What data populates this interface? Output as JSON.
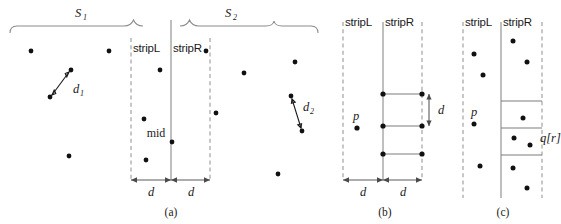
{
  "figure": {
    "panels": [
      {
        "id": "a",
        "caption": "(a)"
      },
      {
        "id": "b",
        "caption": "(b)"
      },
      {
        "id": "c",
        "caption": "(c)"
      }
    ],
    "colors": {
      "dot": "#111111",
      "solid_line": "#8a8a8a",
      "dashed_line": "#9a9a9a",
      "brace": "#8c8c8c",
      "rung": "#7d7d7d",
      "arrow": "#5a5a5a",
      "text": "#1a1a1a",
      "background": "#ffffff"
    }
  },
  "panel_a": {
    "caption": "(a)",
    "brace_left_label": "S",
    "brace_left_sub": "1",
    "brace_right_label": "S",
    "brace_right_sub": "2",
    "strip_left_label": "stripL",
    "strip_right_label": "stripR",
    "mid_label": "mid",
    "dist_left_label": "d",
    "dist_right_label": "d",
    "pair_left_label": "d",
    "pair_left_sub": "1",
    "pair_right_label": "d",
    "pair_right_sub": "2",
    "points": [
      {
        "x": 31,
        "y": 51
      },
      {
        "x": 109,
        "y": 51
      },
      {
        "x": 71,
        "y": 70
      },
      {
        "x": 50,
        "y": 97
      },
      {
        "x": 69,
        "y": 156
      },
      {
        "x": 160,
        "y": 70
      },
      {
        "x": 144,
        "y": 119
      },
      {
        "x": 172,
        "y": 142
      },
      {
        "x": 146,
        "y": 160
      },
      {
        "x": 206,
        "y": 51
      },
      {
        "x": 216,
        "y": 113
      },
      {
        "x": 244,
        "y": 73
      },
      {
        "x": 295,
        "y": 62
      },
      {
        "x": 291,
        "y": 96
      },
      {
        "x": 302,
        "y": 131
      },
      {
        "x": 278,
        "y": 174
      }
    ],
    "pair_left": {
      "x1": 71,
      "y1": 70,
      "x2": 50,
      "y2": 97
    },
    "pair_right": {
      "x1": 291,
      "y1": 96,
      "x2": 302,
      "y2": 131
    },
    "strip_left_x": 131,
    "mid_x": 171,
    "strip_right_x": 210
  },
  "panel_b": {
    "caption": "(b)",
    "strip_left_label": "stripL",
    "strip_right_label": "stripR",
    "point_p_label": "p",
    "dist_left_label": "d",
    "dist_right_label": "d",
    "dist_vertical_label": "d",
    "strip_left_x": 343,
    "mid_x": 383,
    "strip_right_x": 422,
    "points_p": [
      {
        "x": 357,
        "y": 128
      }
    ],
    "rung_points": [
      {
        "x": 383,
        "y": 94
      },
      {
        "x": 422,
        "y": 94
      },
      {
        "x": 383,
        "y": 126
      },
      {
        "x": 422,
        "y": 126
      },
      {
        "x": 383,
        "y": 154
      },
      {
        "x": 422,
        "y": 154
      }
    ],
    "rungs": [
      {
        "y": 94
      },
      {
        "y": 126
      },
      {
        "y": 154
      }
    ]
  },
  "panel_c": {
    "caption": "(c)",
    "strip_left_label": "stripL",
    "strip_right_label": "stripR",
    "point_p_label": "p",
    "point_q_label": "q[r]",
    "strip_left_x": 463,
    "mid_x": 501,
    "strip_right_x": 542,
    "rungs": [
      {
        "y": 101
      },
      {
        "y": 128
      },
      {
        "y": 155
      }
    ],
    "points": [
      {
        "x": 474,
        "y": 54
      },
      {
        "x": 483,
        "y": 75
      },
      {
        "x": 474,
        "y": 124
      },
      {
        "x": 480,
        "y": 166
      },
      {
        "x": 513,
        "y": 41
      },
      {
        "x": 527,
        "y": 62
      },
      {
        "x": 523,
        "y": 118
      },
      {
        "x": 514,
        "y": 138
      },
      {
        "x": 530,
        "y": 145
      },
      {
        "x": 513,
        "y": 168
      },
      {
        "x": 527,
        "y": 188
      }
    ]
  }
}
